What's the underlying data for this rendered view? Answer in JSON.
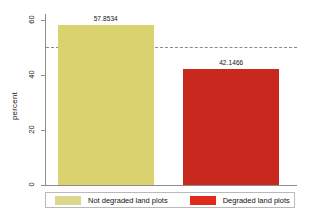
{
  "chart_data": {
    "type": "bar",
    "title": "",
    "xlabel": "",
    "ylabel": "percent",
    "ylim": [
      0,
      62
    ],
    "grid": false,
    "legend_position": "bottom",
    "categories": [
      "Not degraded land plots",
      "Degraded land plots"
    ],
    "values": [
      57.8534,
      42.1466
    ],
    "value_labels": [
      "57.8534",
      "42.1466"
    ],
    "colors": [
      "#d9d26e",
      "#c8281e"
    ],
    "y_ticks": [
      {
        "value": 0,
        "label": "0"
      },
      {
        "value": 20,
        "label": "20"
      },
      {
        "value": 40,
        "label": "40"
      },
      {
        "value": 60,
        "label": "60"
      }
    ],
    "annotations": [
      {
        "type": "reference-line",
        "orientation": "horizontal",
        "value": 50,
        "style": "dashed",
        "color": "#8a8a8a"
      }
    ]
  },
  "axis": {
    "y_title": "percent"
  },
  "legend": {
    "entries": [
      {
        "label": "Not degraded land plots",
        "color": "#ddd78e"
      },
      {
        "label": "Degraded land plots",
        "color": "#e02b1c"
      }
    ]
  }
}
